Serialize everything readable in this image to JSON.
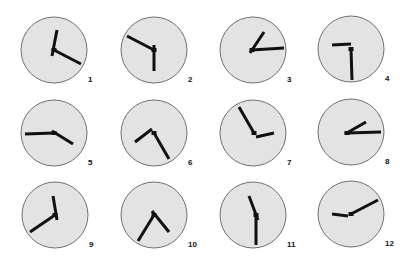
{
  "figure": {
    "width": 407,
    "height": 263,
    "face_fill": "#e3e3e3",
    "face_stroke": "#6f6f6f",
    "hand_color": "#111111",
    "radius": 33
  },
  "clocks": [
    {
      "label": "1",
      "cx": 54,
      "cy": 50,
      "hour": {
        "x": 57,
        "y": 30
      },
      "minute": {
        "x": 81,
        "y": 64
      },
      "tail": {
        "x": 52,
        "y": 56
      }
    },
    {
      "label": "2",
      "cx": 154,
      "cy": 50,
      "hour": {
        "x": 154,
        "y": 71
      },
      "minute": {
        "x": 127,
        "y": 36
      },
      "tail": {
        "x": 154,
        "y": 45
      }
    },
    {
      "label": "3",
      "cx": 252,
      "cy": 50,
      "hour": {
        "x": 264,
        "y": 32
      },
      "minute": {
        "x": 284,
        "y": 48
      },
      "tail": {
        "x": 250,
        "y": 53
      }
    },
    {
      "label": "4",
      "cx": 351,
      "cy": 49,
      "hour": {
        "x": 332,
        "y": 45
      },
      "minute": {
        "x": 352,
        "y": 80
      },
      "tail": {
        "x": 351,
        "y": 44
      }
    },
    {
      "label": "5",
      "cx": 54,
      "cy": 133,
      "hour": {
        "x": 73,
        "y": 144
      },
      "minute": {
        "x": 25,
        "y": 134
      },
      "tail": {
        "x": 52,
        "y": 131
      }
    },
    {
      "label": "6",
      "cx": 154,
      "cy": 133,
      "hour": {
        "x": 135,
        "y": 142
      },
      "minute": {
        "x": 169,
        "y": 159
      },
      "tail": {
        "x": 152,
        "y": 129
      }
    },
    {
      "label": "7",
      "cx": 254,
      "cy": 133,
      "hour": {
        "x": 274,
        "y": 133
      },
      "minute": {
        "x": 239,
        "y": 107
      },
      "tail": {
        "x": 256,
        "y": 137
      }
    },
    {
      "label": "8",
      "cx": 347,
      "cy": 133,
      "hour": {
        "x": 366,
        "y": 122
      },
      "minute": {
        "x": 381,
        "y": 132
      },
      "tail": {
        "x": 345,
        "y": 134
      }
    },
    {
      "label": "9",
      "cx": 55,
      "cy": 215,
      "hour": {
        "x": 53,
        "y": 196
      },
      "minute": {
        "x": 30,
        "y": 232
      },
      "tail": {
        "x": 57,
        "y": 220
      }
    },
    {
      "label": "10",
      "cx": 154,
      "cy": 215,
      "hour": {
        "x": 169,
        "y": 232
      },
      "minute": {
        "x": 138,
        "y": 241
      },
      "tail": {
        "x": 152,
        "y": 211
      }
    },
    {
      "label": "11",
      "cx": 256,
      "cy": 215,
      "hour": {
        "x": 249,
        "y": 196
      },
      "minute": {
        "x": 256,
        "y": 245
      },
      "tail": {
        "x": 258,
        "y": 220
      }
    },
    {
      "label": "12",
      "cx": 351,
      "cy": 214,
      "hour": {
        "x": 332,
        "y": 214
      },
      "minute": {
        "x": 378,
        "y": 200
      },
      "tail": {
        "x": 348,
        "y": 216
      }
    }
  ],
  "circles": [
    {
      "cx": 54,
      "cy": 50
    },
    {
      "cx": 154,
      "cy": 50
    },
    {
      "cx": 253,
      "cy": 50
    },
    {
      "cx": 351,
      "cy": 49
    },
    {
      "cx": 54,
      "cy": 133
    },
    {
      "cx": 154,
      "cy": 133
    },
    {
      "cx": 253,
      "cy": 133
    },
    {
      "cx": 351,
      "cy": 132
    },
    {
      "cx": 55,
      "cy": 215
    },
    {
      "cx": 154,
      "cy": 215
    },
    {
      "cx": 253,
      "cy": 215
    },
    {
      "cx": 351,
      "cy": 214
    }
  ]
}
